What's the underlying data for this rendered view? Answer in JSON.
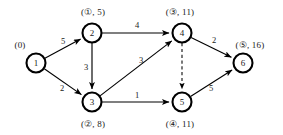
{
  "diagram": {
    "background_color": "#ffffff",
    "stroke_color": "#000000",
    "nodes": [
      {
        "id": "1",
        "cx": 36,
        "cy": 63,
        "r": 9.5,
        "label": "(0)",
        "label_x": 20,
        "label_y": 45
      },
      {
        "id": "2",
        "cx": 92,
        "cy": 33,
        "r": 9.5,
        "label": "(①, 5)",
        "label_x": 93,
        "label_y": 12
      },
      {
        "id": "3",
        "cx": 92,
        "cy": 102,
        "r": 9.5,
        "label": "(②, 8)",
        "label_x": 93,
        "label_y": 124
      },
      {
        "id": "4",
        "cx": 182,
        "cy": 33,
        "r": 9.5,
        "label": "(③, 11)",
        "label_x": 180,
        "label_y": 12
      },
      {
        "id": "5",
        "cx": 182,
        "cy": 102,
        "r": 9.5,
        "label": "(④, 11)",
        "label_x": 180,
        "label_y": 124
      },
      {
        "id": "6",
        "cx": 243,
        "cy": 63,
        "r": 9.5,
        "label": "(⑤, 16)",
        "label_x": 250,
        "label_y": 45
      }
    ],
    "edges": [
      {
        "from": "1",
        "to": "2",
        "weight": "5",
        "wx": 63,
        "wy": 41,
        "dashed": false,
        "arrow": true
      },
      {
        "from": "1",
        "to": "3",
        "weight": "2",
        "wx": 62,
        "wy": 88,
        "dashed": false,
        "arrow": true
      },
      {
        "from": "2",
        "to": "3",
        "weight": "3",
        "wx": 86,
        "wy": 67,
        "dashed": false,
        "arrow": true
      },
      {
        "from": "2",
        "to": "4",
        "weight": "4",
        "wx": 137,
        "wy": 25,
        "dashed": false,
        "arrow": true
      },
      {
        "from": "3",
        "to": "4",
        "weight": "3",
        "wx": 141,
        "wy": 60,
        "dashed": false,
        "arrow": true
      },
      {
        "from": "3",
        "to": "5",
        "weight": "1",
        "wx": 137,
        "wy": 95,
        "dashed": false,
        "arrow": true
      },
      {
        "from": "4",
        "to": "6",
        "weight": "2",
        "wx": 214,
        "wy": 40,
        "dashed": false,
        "arrow": true
      },
      {
        "from": "5",
        "to": "6",
        "weight": "5",
        "wx": 211,
        "wy": 88,
        "dashed": false,
        "arrow": true
      },
      {
        "from": "4",
        "to": "5",
        "weight": "",
        "wx": 0,
        "wy": 0,
        "dashed": true,
        "arrow": true
      }
    ]
  }
}
